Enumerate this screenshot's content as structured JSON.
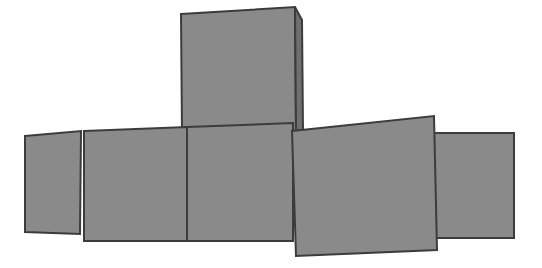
{
  "canvas": {
    "width": 542,
    "height": 268,
    "background": "#ffffff",
    "title": "overlapping-gray-quadrilaterals"
  },
  "style": {
    "fill": "#8a8a8a",
    "stroke": "#3c3c3c",
    "stroke_width": 2
  },
  "shapes": [
    {
      "name": "panel-left-back",
      "label": "leftmost rectangle",
      "points": "25,136 81,131 80,234 25,232",
      "fill": "#8a8a8a",
      "stroke": "#3c3c3c",
      "stroke_width": 2,
      "z": 1
    },
    {
      "name": "panel-top-tall",
      "label": "top vertical rectangle",
      "points": "181,14 295,7 296,131 182,133",
      "fill": "#8a8a8a",
      "stroke": "#3c3c3c",
      "stroke_width": 2,
      "z": 2
    },
    {
      "name": "panel-top-tall-side",
      "label": "top rectangle right side face",
      "points": "295,7 302,20 303,130 296,131",
      "fill": "#6f6f6f",
      "stroke": "#3c3c3c",
      "stroke_width": 2,
      "z": 2
    },
    {
      "name": "panel-right-back",
      "label": "rightmost rectangle",
      "points": "434,133 514,133 514,238 434,238",
      "fill": "#8a8a8a",
      "stroke": "#3c3c3c",
      "stroke_width": 2,
      "z": 3
    },
    {
      "name": "panel-center-left",
      "label": "center-left rectangle",
      "points": "84,131 187,127 187,241 84,241",
      "fill": "#8a8a8a",
      "stroke": "#3c3c3c",
      "stroke_width": 2,
      "z": 4
    },
    {
      "name": "panel-center-right",
      "label": "center-right rectangle",
      "points": "187,127 293,123 293,241 187,241",
      "fill": "#8a8a8a",
      "stroke": "#3c3c3c",
      "stroke_width": 2,
      "z": 5
    },
    {
      "name": "panel-front-right",
      "label": "front right rectangle",
      "points": "292,131 434,116 437,250 296,256",
      "fill": "#8a8a8a",
      "stroke": "#3c3c3c",
      "stroke_width": 2,
      "z": 6
    }
  ]
}
